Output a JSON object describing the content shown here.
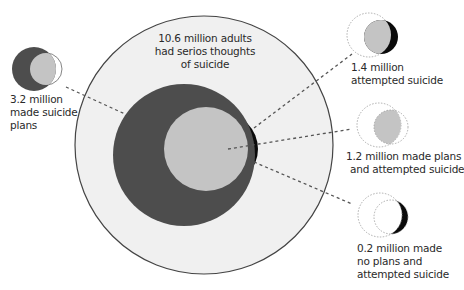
{
  "diagram": {
    "type": "nested-venn",
    "colors": {
      "outer_fill": "#f0f0f0",
      "outer_stroke": "#444444",
      "plans_fill": "#4d4d4d",
      "plans_and_attempt_fill": "#c4c4c4",
      "attempt_no_plans_fill": "#0a0a0a",
      "dashed_line": "#555555"
    },
    "main": {
      "label_lines": [
        "10.6 million adults",
        "had serios thoughts",
        "of suicide"
      ]
    },
    "callouts": [
      {
        "id": "plans",
        "value": "3.2 million",
        "label_lines": [
          "3.2 million",
          "made suicide",
          "plans"
        ]
      },
      {
        "id": "attempted",
        "value": "1.4 million",
        "label_lines": [
          "1.4 million",
          "attempted suicide"
        ]
      },
      {
        "id": "plans-and-attempted",
        "value": "1.2 million",
        "label_lines": [
          "1.2 million made plans",
          "and attempted suicide"
        ]
      },
      {
        "id": "no-plans-attempted",
        "value": "0.2 million",
        "label_lines": [
          "0.2 million made",
          "no plans and",
          "attempted suicide"
        ]
      }
    ]
  }
}
